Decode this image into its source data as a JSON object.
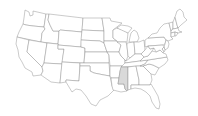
{
  "map": {
    "title": "United States",
    "highlighted_state": "Mississippi",
    "colors": {
      "background": "#ffffff",
      "state_fill": "#ffffff",
      "highlight_fill": "#d9d9d9",
      "border": "#8a8a8a"
    },
    "states": [
      {
        "id": "WA",
        "name": "Washington"
      },
      {
        "id": "OR",
        "name": "Oregon"
      },
      {
        "id": "CA",
        "name": "California"
      },
      {
        "id": "ID",
        "name": "Idaho"
      },
      {
        "id": "NV",
        "name": "Nevada"
      },
      {
        "id": "MT",
        "name": "Montana"
      },
      {
        "id": "WY",
        "name": "Wyoming"
      },
      {
        "id": "UT",
        "name": "Utah"
      },
      {
        "id": "AZ",
        "name": "Arizona"
      },
      {
        "id": "CO",
        "name": "Colorado"
      },
      {
        "id": "NM",
        "name": "New Mexico"
      },
      {
        "id": "ND",
        "name": "North Dakota"
      },
      {
        "id": "SD",
        "name": "South Dakota"
      },
      {
        "id": "NE",
        "name": "Nebraska"
      },
      {
        "id": "KS",
        "name": "Kansas"
      },
      {
        "id": "OK",
        "name": "Oklahoma"
      },
      {
        "id": "TX",
        "name": "Texas"
      },
      {
        "id": "MN",
        "name": "Minnesota"
      },
      {
        "id": "IA",
        "name": "Iowa"
      },
      {
        "id": "MO",
        "name": "Missouri"
      },
      {
        "id": "AR",
        "name": "Arkansas"
      },
      {
        "id": "LA",
        "name": "Louisiana"
      },
      {
        "id": "WI",
        "name": "Wisconsin"
      },
      {
        "id": "IL",
        "name": "Illinois"
      },
      {
        "id": "MI",
        "name": "Michigan"
      },
      {
        "id": "IN",
        "name": "Indiana"
      },
      {
        "id": "OH",
        "name": "Ohio"
      },
      {
        "id": "KY",
        "name": "Kentucky"
      },
      {
        "id": "TN",
        "name": "Tennessee"
      },
      {
        "id": "MS",
        "name": "Mississippi",
        "highlighted": true
      },
      {
        "id": "AL",
        "name": "Alabama"
      },
      {
        "id": "GA",
        "name": "Georgia"
      },
      {
        "id": "FL",
        "name": "Florida"
      },
      {
        "id": "SC",
        "name": "South Carolina"
      },
      {
        "id": "NC",
        "name": "North Carolina"
      },
      {
        "id": "VA",
        "name": "Virginia"
      },
      {
        "id": "WV",
        "name": "West Virginia"
      },
      {
        "id": "PA",
        "name": "Pennsylvania"
      },
      {
        "id": "NY",
        "name": "New York"
      },
      {
        "id": "VT",
        "name": "Vermont"
      },
      {
        "id": "NH",
        "name": "New Hampshire"
      },
      {
        "id": "ME",
        "name": "Maine"
      },
      {
        "id": "MA",
        "name": "Massachusetts"
      },
      {
        "id": "CT",
        "name": "Connecticut"
      },
      {
        "id": "RI",
        "name": "Rhode Island"
      },
      {
        "id": "NJ",
        "name": "New Jersey"
      },
      {
        "id": "DE",
        "name": "Delaware"
      },
      {
        "id": "MD",
        "name": "Maryland"
      }
    ]
  }
}
